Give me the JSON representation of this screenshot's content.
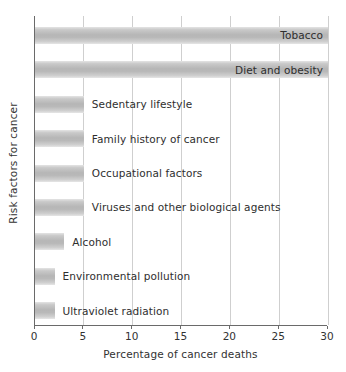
{
  "chart_data": {
    "type": "bar",
    "orientation": "horizontal",
    "title": "",
    "xlabel": "Percentage of cancer deaths",
    "ylabel": "Risk factors for cancer",
    "xlim": [
      0,
      30
    ],
    "xticks": [
      0,
      5,
      10,
      15,
      20,
      25,
      30
    ],
    "xtick_labels": [
      "0",
      "5",
      "10",
      "15",
      "20",
      "25",
      "30"
    ],
    "grid": "vertical",
    "legend": "none",
    "bar_color": "#bdbdbd",
    "categories": [
      "Tobacco",
      "Diet and obesity",
      "Sedentary lifestyle",
      "Family history of cancer",
      "Occupational factors",
      "Viruses and other biological agents",
      "Alcohol",
      "Environmental pollution",
      "Ultraviolet radiation"
    ],
    "values": [
      30,
      30,
      5,
      5,
      5,
      5,
      3,
      2,
      2
    ],
    "bars": [
      {
        "label": "Tobacco",
        "value": 30,
        "label_position": "inside"
      },
      {
        "label": "Diet and obesity",
        "value": 30,
        "label_position": "inside"
      },
      {
        "label": "Sedentary lifestyle",
        "value": 5,
        "label_position": "outside"
      },
      {
        "label": "Family history of cancer",
        "value": 5,
        "label_position": "outside"
      },
      {
        "label": "Occupational factors",
        "value": 5,
        "label_position": "outside"
      },
      {
        "label": "Viruses and other biological agents",
        "value": 5,
        "label_position": "outside"
      },
      {
        "label": "Alcohol",
        "value": 3,
        "label_position": "outside"
      },
      {
        "label": "Environmental pollution",
        "value": 2,
        "label_position": "outside"
      },
      {
        "label": "Ultraviolet radiation",
        "value": 2,
        "label_position": "outside"
      }
    ]
  }
}
